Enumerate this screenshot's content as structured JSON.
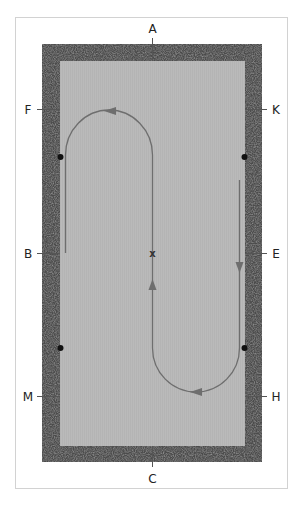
{
  "diagram": {
    "colors": {
      "border_dark": "#4a4a4a",
      "arena": "#b8b8b8",
      "path": "#6e6e6e",
      "marker_dot": "#111111",
      "frame": "#d2d2d2"
    },
    "letters": {
      "top": "A",
      "left_upper": "F",
      "right_upper": "K",
      "left_middle": "B",
      "right_middle": "E",
      "left_lower": "M",
      "right_lower": "H",
      "bottom": "C"
    },
    "center_marker": "x",
    "markers": [
      "quarter-dot-left-upper",
      "quarter-dot-right-upper",
      "quarter-dot-left-lower",
      "quarter-dot-right-lower"
    ]
  }
}
